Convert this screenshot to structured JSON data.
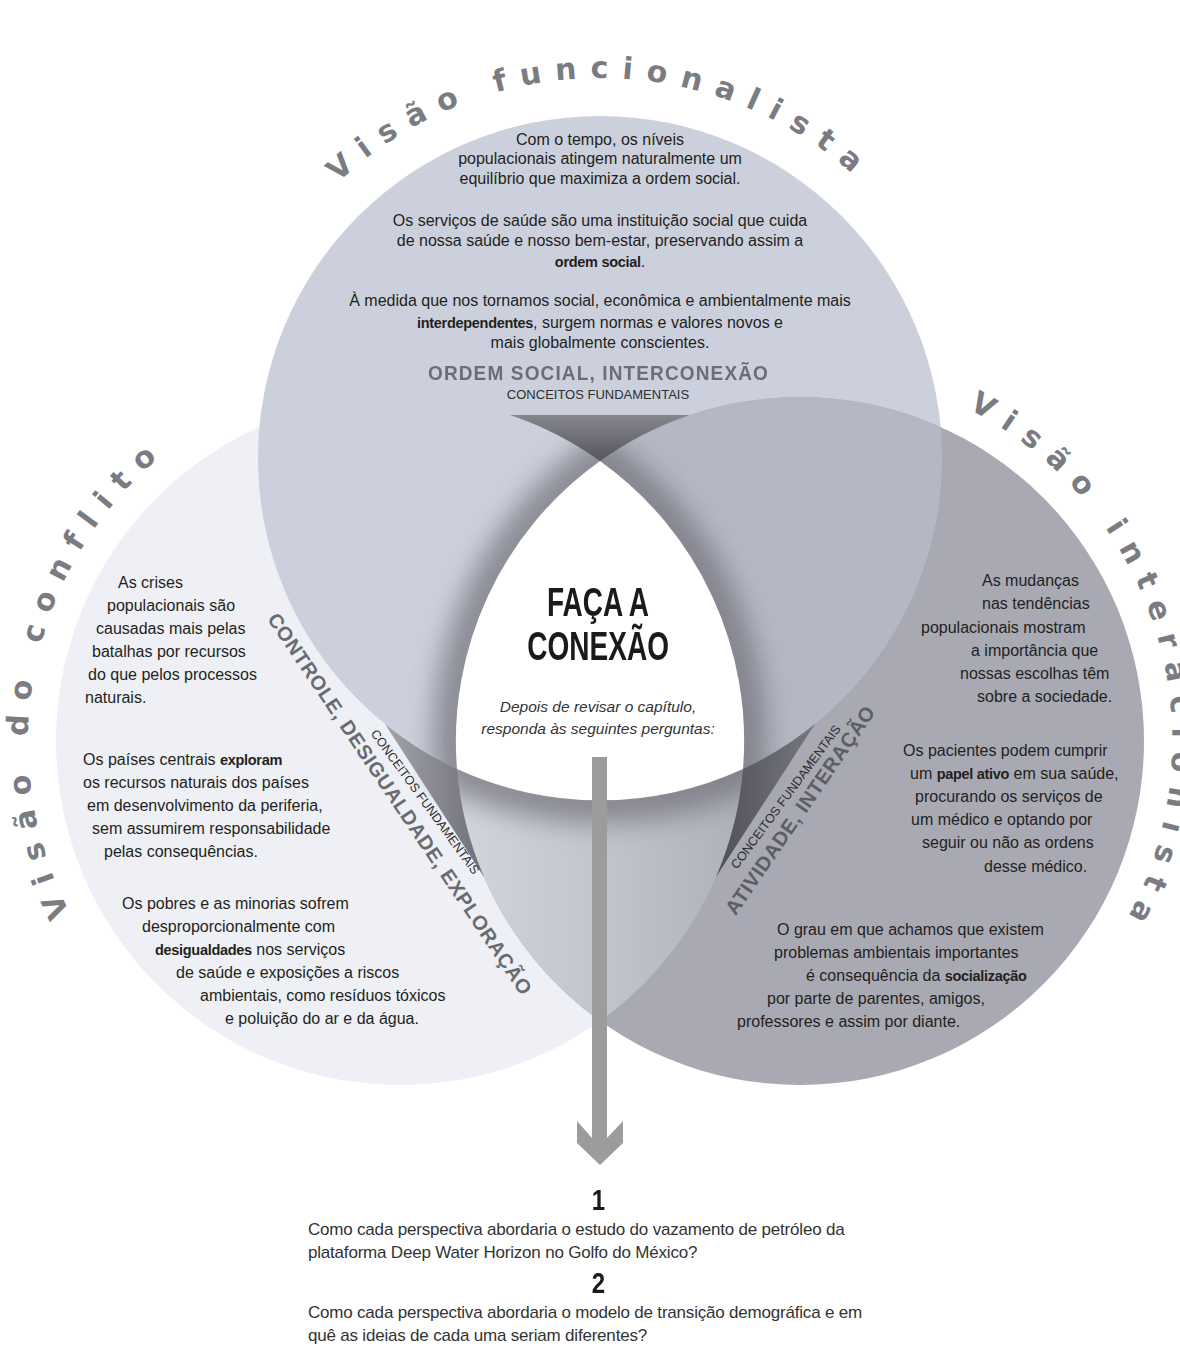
{
  "perspectives": {
    "functionalist": {
      "title": "Visão funcionalista",
      "paragraphs": [
        [
          "Com o tempo, os níveis",
          "populacionais atingem naturalmente um",
          "equilíbrio que maximiza a ordem social."
        ],
        [
          "Os serviços de saúde são uma instituição social que cuida",
          "de nossa saúde e nosso bem-estar, preservando assim a",
          {
            "pre": "",
            "bold": "ordem social",
            "post": "."
          }
        ],
        [
          "À medida que nos tornamos social, econômica e ambientalmente mais",
          {
            "pre": "",
            "bold": "interdependentes",
            "post": ", surgem normas e valores novos e"
          },
          "mais globalmente conscientes."
        ]
      ],
      "key_concepts": "ORDEM SOCIAL, INTERCONEXÃO",
      "key_concepts_label": "CONCEITOS FUNDAMENTAIS"
    },
    "conflict": {
      "title": "Visão do conflito",
      "paragraphs": [
        [
          "As crises",
          "populacionais são",
          "causadas mais pelas",
          "batalhas por recursos",
          "do que pelos processos",
          "naturais."
        ],
        [
          {
            "pre": "Os países centrais ",
            "bold": "exploram",
            "post": ""
          },
          "os recursos naturais dos países",
          "em desenvolvimento da periferia,",
          "sem assumirem responsabilidade",
          "pelas consequências."
        ],
        [
          "Os pobres e as minorias sofrem",
          "desproporcionalmente com",
          {
            "pre": "",
            "bold": "desigualdades",
            "post": " nos serviços"
          },
          "de saúde e exposições a riscos",
          "ambientais, como resíduos tóxicos",
          "e poluição do ar e da água."
        ]
      ],
      "key_concepts": "CONTROLE, DESIGUALDADE, EXPLORAÇÃO",
      "key_concepts_label": "CONCEITOS FUNDAMENTAIS"
    },
    "interactionist": {
      "title": "Visão interacionista",
      "paragraphs": [
        [
          "As mudanças",
          "nas tendências",
          "populacionais mostram",
          "a importância que",
          "nossas escolhas têm",
          "sobre a sociedade."
        ],
        [
          "Os pacientes podem cumprir",
          {
            "pre": "um ",
            "bold": "papel ativo",
            "post": " em sua saúde,"
          },
          "procurando os serviços de",
          "um médico e optando por",
          "seguir ou não as ordens",
          "desse médico."
        ],
        [
          "O grau em que achamos que existem",
          "problemas ambientais importantes",
          {
            "pre": "é consequência da ",
            "bold": "socialização",
            "post": ""
          },
          "por parte de parentes, amigos,",
          "professores e assim por diante."
        ]
      ],
      "key_concepts": "ATIVIDADE, INTERAÇÃO",
      "key_concepts_label": "CONCEITOS FUNDAMENTAIS"
    }
  },
  "center": {
    "title_lines": [
      "FAÇA A",
      "CONEXÃO"
    ],
    "subtitle_lines": [
      "Depois de revisar o capítulo,",
      "responda às seguintes perguntas:"
    ],
    "connector_icon": "arrow-down-icon"
  },
  "questions": [
    {
      "number": "1",
      "lines": [
        "Como cada perspectiva abordaria o estudo do vazamento de petróleo da",
        "plataforma Deep Water Horizon no Golfo do México?"
      ]
    },
    {
      "number": "2",
      "lines": [
        "Como cada perspectiva abordaria o modelo de transição demográfica e em",
        "quê as ideias de cada uma seriam diferentes?"
      ]
    }
  ],
  "colors": {
    "background": "#ffffff",
    "functionalist_circle": "#ccd0dc",
    "conflict_circle": "#eef0f5",
    "interactionist_circle": "#a8a9b3",
    "center_region": "#ffffff",
    "title_gray": "#7b7c82",
    "key_concepts_gray": "#6d6e74",
    "body_text": "#231f20",
    "arrow": "#9c9c9e",
    "wedge_dark": "#55565e"
  }
}
